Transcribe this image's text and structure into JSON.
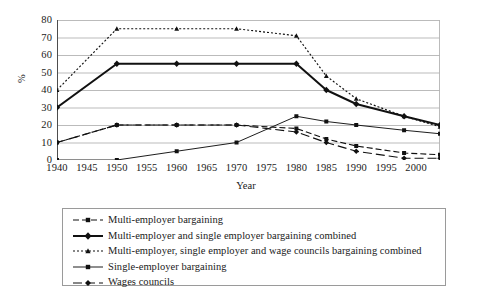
{
  "chart_data": {
    "type": "line",
    "title": "",
    "xlabel": "Year",
    "ylabel": "%",
    "xlim": [
      1940,
      2004
    ],
    "ylim": [
      0,
      80
    ],
    "grid": "horizontal",
    "legend_position": "bottom",
    "xticks": [
      1940,
      1945,
      1950,
      1955,
      1960,
      1965,
      1970,
      1975,
      1980,
      1985,
      1990,
      1995,
      2000
    ],
    "yticks": [
      0,
      10,
      20,
      30,
      40,
      50,
      60,
      70,
      80
    ],
    "series": [
      {
        "name": "Multi-employer bargaining",
        "style": "dashed",
        "marker": "square",
        "points": [
          {
            "x": 1940,
            "y": 10
          },
          {
            "x": 1950,
            "y": 20
          },
          {
            "x": 1960,
            "y": 20
          },
          {
            "x": 1970,
            "y": 20
          },
          {
            "x": 1980,
            "y": 18
          },
          {
            "x": 1985,
            "y": 12
          },
          {
            "x": 1990,
            "y": 8
          },
          {
            "x": 1998,
            "y": 4
          },
          {
            "x": 2004,
            "y": 3
          }
        ]
      },
      {
        "name": "Multi-employer and single employer bargaining combined",
        "style": "solid-thick",
        "marker": "diamond",
        "points": [
          {
            "x": 1940,
            "y": 30
          },
          {
            "x": 1950,
            "y": 55
          },
          {
            "x": 1960,
            "y": 55
          },
          {
            "x": 1970,
            "y": 55
          },
          {
            "x": 1980,
            "y": 55
          },
          {
            "x": 1985,
            "y": 40
          },
          {
            "x": 1990,
            "y": 32
          },
          {
            "x": 1998,
            "y": 25
          },
          {
            "x": 2004,
            "y": 20
          }
        ]
      },
      {
        "name": "Multi-employer, single employer and wage councils bargaining combined",
        "style": "dotted",
        "marker": "triangle",
        "points": [
          {
            "x": 1940,
            "y": 40
          },
          {
            "x": 1950,
            "y": 75
          },
          {
            "x": 1960,
            "y": 75
          },
          {
            "x": 1970,
            "y": 75
          },
          {
            "x": 1980,
            "y": 71
          },
          {
            "x": 1985,
            "y": 48
          },
          {
            "x": 1990,
            "y": 35
          },
          {
            "x": 1998,
            "y": 25
          },
          {
            "x": 2004,
            "y": 19
          }
        ]
      },
      {
        "name": "Single-employer bargaining",
        "style": "solid-thin",
        "marker": "square",
        "points": [
          {
            "x": 1940,
            "y": 0
          },
          {
            "x": 1950,
            "y": 0
          },
          {
            "x": 1960,
            "y": 5
          },
          {
            "x": 1970,
            "y": 10
          },
          {
            "x": 1980,
            "y": 25
          },
          {
            "x": 1985,
            "y": 22
          },
          {
            "x": 1990,
            "y": 20
          },
          {
            "x": 1998,
            "y": 17
          },
          {
            "x": 2004,
            "y": 15
          }
        ]
      },
      {
        "name": "Wages councils",
        "style": "dash-long",
        "marker": "diamond",
        "points": [
          {
            "x": 1940,
            "y": 10
          },
          {
            "x": 1950,
            "y": 20
          },
          {
            "x": 1960,
            "y": 20
          },
          {
            "x": 1970,
            "y": 20
          },
          {
            "x": 1980,
            "y": 16
          },
          {
            "x": 1985,
            "y": 10
          },
          {
            "x": 1990,
            "y": 5
          },
          {
            "x": 1998,
            "y": 1
          },
          {
            "x": 2004,
            "y": 1
          }
        ]
      }
    ]
  },
  "legend": {
    "items": [
      {
        "label": "Multi-employer bargaining"
      },
      {
        "label": "Multi-employer and single employer bargaining combined"
      },
      {
        "label": "Multi-employer, single employer and wage councils bargaining combined"
      },
      {
        "label": "Single-employer bargaining"
      },
      {
        "label": "Wages councils"
      }
    ]
  }
}
